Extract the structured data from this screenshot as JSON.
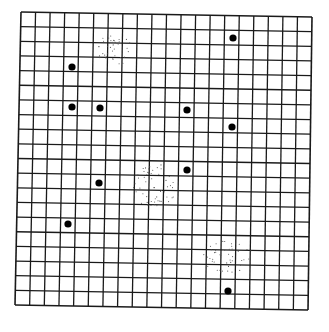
{
  "diagram": {
    "type": "grid-with-points",
    "grid": {
      "columns": 20,
      "rows": 20,
      "corners": {
        "top_left": [
          21,
          12
        ],
        "top_right": [
          312,
          17
        ],
        "bottom_right": [
          308,
          310
        ],
        "bottom_left": [
          15,
          305
        ]
      },
      "line_color": "#1a1a1a",
      "background": "#ffffff"
    },
    "points": {
      "color": "#000000",
      "radius": 3.6,
      "items": [
        {
          "x": 233,
          "y": 38
        },
        {
          "x": 72,
          "y": 67
        },
        {
          "x": 72,
          "y": 107
        },
        {
          "x": 100,
          "y": 108
        },
        {
          "x": 187,
          "y": 110
        },
        {
          "x": 232,
          "y": 127
        },
        {
          "x": 187,
          "y": 170
        },
        {
          "x": 99,
          "y": 183
        },
        {
          "x": 68,
          "y": 224
        },
        {
          "x": 228,
          "y": 291
        }
      ]
    },
    "stipple_clusters": {
      "color": "#555555",
      "items": [
        {
          "cx": 115,
          "cy": 50,
          "rx": 18,
          "ry": 16,
          "count": 40
        },
        {
          "cx": 155,
          "cy": 186,
          "rx": 22,
          "ry": 22,
          "count": 55
        },
        {
          "cx": 228,
          "cy": 257,
          "rx": 26,
          "ry": 16,
          "count": 45
        }
      ]
    }
  }
}
